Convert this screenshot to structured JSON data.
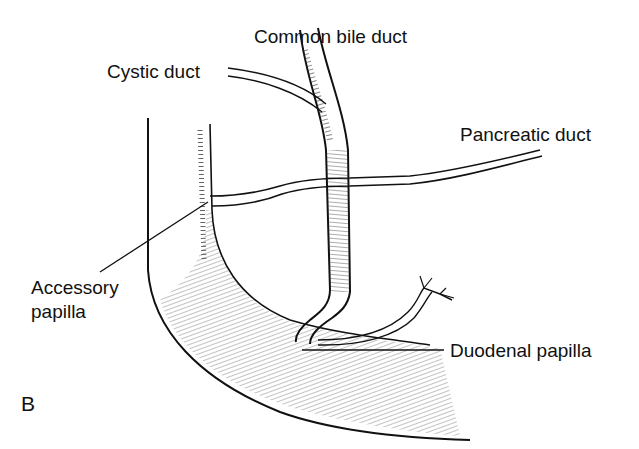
{
  "figure": {
    "panel_letter": "B",
    "labels": {
      "common_bile_duct": "Common bile duct",
      "cystic_duct": "Cystic duct",
      "pancreatic_duct": "Pancreatic duct",
      "accessory_papilla_line1": "Accessory",
      "accessory_papilla_line2": "papilla",
      "duodenal_papilla": "Duodenal papilla"
    },
    "colors": {
      "ink": "#111111",
      "background": "#ffffff"
    }
  }
}
